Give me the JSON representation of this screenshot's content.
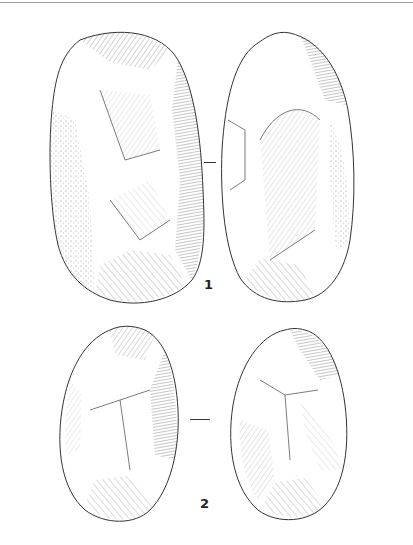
{
  "figure": {
    "artefacts": [
      {
        "label": "1",
        "views": [
          "face A",
          "face B"
        ]
      },
      {
        "label": "2",
        "views": [
          "face A",
          "face B"
        ]
      }
    ]
  },
  "colors": {
    "ink": "#222222",
    "rule": "#9a9a9a",
    "background": "#ffffff"
  }
}
